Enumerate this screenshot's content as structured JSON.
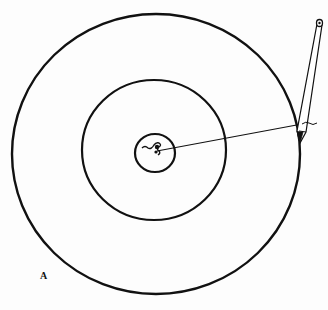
{
  "figure": {
    "panel_label": "A",
    "colors": {
      "stroke": "#111111",
      "background": "#fdfdfd"
    },
    "circles": [
      {
        "name": "outer",
        "cx": 156,
        "cy": 154,
        "rx": 144,
        "ry": 140
      },
      {
        "name": "middle",
        "cx": 154,
        "cy": 150,
        "rx": 72,
        "ry": 70
      },
      {
        "name": "inner",
        "cx": 155,
        "cy": 153,
        "rx": 20,
        "ry": 19
      }
    ],
    "string_line": {
      "x1": 157,
      "y1": 151,
      "x2": 302,
      "y2": 124
    },
    "pencil": {
      "tip_x": 301,
      "tip_y": 141,
      "top_x": 320,
      "top_y": 22
    }
  }
}
